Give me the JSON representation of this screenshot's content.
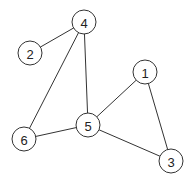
{
  "graph": {
    "type": "undirected",
    "nodes": [
      {
        "id": "1",
        "label": "1"
      },
      {
        "id": "2",
        "label": "2"
      },
      {
        "id": "3",
        "label": "3"
      },
      {
        "id": "4",
        "label": "4"
      },
      {
        "id": "5",
        "label": "5"
      },
      {
        "id": "6",
        "label": "6"
      }
    ],
    "edges": [
      {
        "source": "4",
        "target": "2"
      },
      {
        "source": "4",
        "target": "6"
      },
      {
        "source": "4",
        "target": "5"
      },
      {
        "source": "1",
        "target": "5"
      },
      {
        "source": "1",
        "target": "3"
      },
      {
        "source": "5",
        "target": "6"
      },
      {
        "source": "5",
        "target": "3"
      }
    ]
  },
  "colors": {
    "stroke": "#333333",
    "node_fill": "#ffffff",
    "label": "#222222"
  }
}
